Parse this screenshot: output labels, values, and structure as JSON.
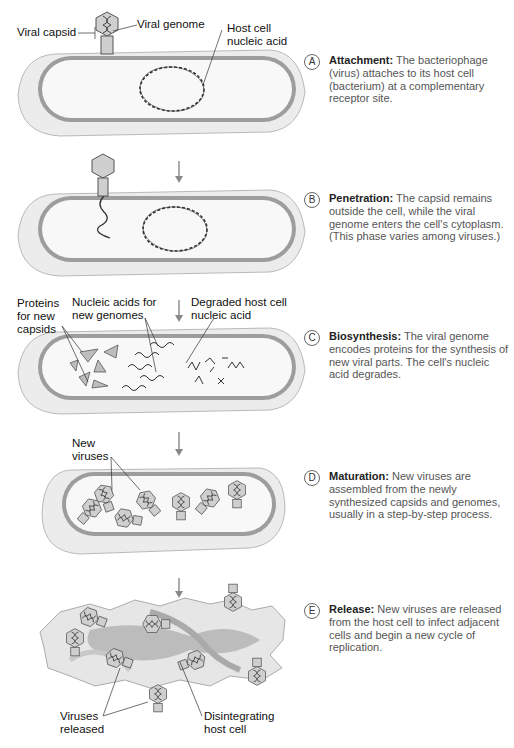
{
  "figure": {
    "colors": {
      "cell_outer": "#eeeeee",
      "cell_wall": "#9a9a9a",
      "cytoplasm": "#f7f7f7",
      "virus_fill": "#cfcfcf",
      "virus_stroke": "#555555",
      "arrow": "#888888",
      "debris": "#b5b5b5"
    }
  },
  "stage_a": {
    "labels": {
      "viral_capsid": "Viral capsid",
      "viral_genome": "Viral genome",
      "host_nucleic_acid": "Host cell\nnucleic acid"
    }
  },
  "stage_c": {
    "labels": {
      "proteins": "Proteins\nfor new\ncapsids",
      "nucleic_acids": "Nucleic acids for\nnew genomes",
      "degraded": "Degraded host cell\nnucleic acid"
    }
  },
  "stage_d": {
    "labels": {
      "new_viruses": "New\nviruses"
    }
  },
  "stage_e": {
    "labels": {
      "released": "Viruses\nreleased",
      "disintegrating": "Disintegrating\nhost cell"
    }
  },
  "steps": [
    {
      "letter": "A",
      "title": "Attachment:",
      "text": " The bacteriophage (virus) attaches to its host cell (bacterium) at a complementary receptor site."
    },
    {
      "letter": "B",
      "title": "Penetration:",
      "text": " The capsid remains outside the cell, while the viral genome enters the cell's cytoplasm. (This phase varies among viruses.)"
    },
    {
      "letter": "C",
      "title": "Biosynthesis:",
      "text": " The viral genome encodes proteins for the synthesis of new viral parts. The cell's nucleic acid degrades."
    },
    {
      "letter": "D",
      "title": "Maturation:",
      "text": " New viruses are assembled from the newly synthesized capsids and genomes, usually in a step-by-step process."
    },
    {
      "letter": "E",
      "title": "Release:",
      "text": " New viruses are released from the host cell to infect adjacent cells and begin a new cycle of replication."
    }
  ]
}
